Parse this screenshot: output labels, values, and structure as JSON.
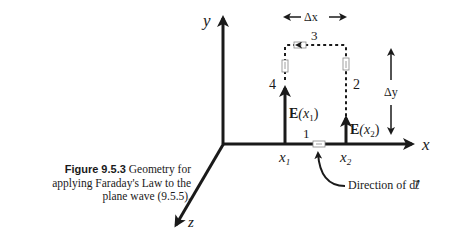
{
  "figure": {
    "number": "Figure 9.5.3",
    "caption_text": "Geometry for applying Faraday's Law to the plane wave (9.5.5).",
    "caption_line1_rest": "Geometry for",
    "caption_line2": "applying Faraday's Law to the",
    "caption_line3": "plane wave (9.5.5)."
  },
  "axes": {
    "x_label": "x",
    "y_label": "y",
    "z_label": "z"
  },
  "positions": {
    "x1": "x",
    "x1_sub": "1",
    "x2": "x",
    "x2_sub": "2"
  },
  "field_vectors": {
    "e1_label_main": "E",
    "e1_label_arg": "(x",
    "e1_label_sub": "1",
    "e1_label_close": ")",
    "e2_label_main": "E",
    "e2_label_arg": "(x",
    "e2_label_sub": "2",
    "e2_label_close": ")"
  },
  "loop": {
    "segments": [
      "1",
      "2",
      "3",
      "4"
    ],
    "dx_label": "Δx",
    "dy_label": "Δy"
  },
  "annotation": {
    "direction_label": "Direction of dℓ⃗"
  },
  "colors": {
    "ink": "#1a1a1a",
    "background": "#ffffff"
  }
}
